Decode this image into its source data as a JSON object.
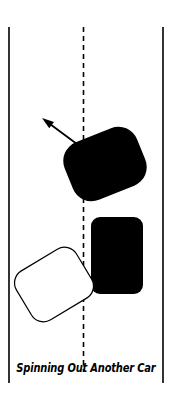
{
  "figure": {
    "caption": "Spinning Out Another Car",
    "background_color": "#ffffff",
    "ink_color": "#000000",
    "width": 172,
    "height": 401
  },
  "road": {
    "left_edge": {
      "name": "left road edge line",
      "x": 9,
      "y_top": 27,
      "y_bottom": 383,
      "stroke_width": 1.6,
      "color": "#000000"
    },
    "right_edge": {
      "name": "right road edge line",
      "x": 163,
      "y_top": 27,
      "y_bottom": 383,
      "stroke_width": 1.6,
      "color": "#000000"
    },
    "center_line": {
      "name": "dashed center lane line",
      "x": 83.5,
      "y_top": 27,
      "y_bottom": 372,
      "stroke_width": 1.6,
      "dash": "5 4",
      "color": "#000000"
    }
  },
  "vehicles": [
    {
      "id": "spun-car",
      "label": "spinning black car",
      "fill": "#000000",
      "stroke": "none",
      "x": 66,
      "y": 133,
      "width": 78,
      "height": 62,
      "corner_radius": 20,
      "rotation_deg": -22
    },
    {
      "id": "subject-car",
      "label": "upright black car",
      "fill": "#000000",
      "stroke": "none",
      "x": 91,
      "y": 217,
      "width": 52,
      "height": 77,
      "corner_radius": 9,
      "rotation_deg": 0
    },
    {
      "id": "outlined-car",
      "label": "white outlined car",
      "fill": "#ffffff",
      "stroke": "#000000",
      "stroke_width": 1.2,
      "x": 19,
      "y": 256,
      "width": 70,
      "height": 57,
      "corner_radius": 14,
      "rotation_deg": -31
    }
  ],
  "arrow": {
    "label": "spin direction arrow",
    "from_x": 85,
    "from_y": 150,
    "to_x": 42,
    "to_y": 118,
    "stroke_width": 1.8,
    "head_length": 12,
    "head_width": 8,
    "color": "#000000"
  }
}
